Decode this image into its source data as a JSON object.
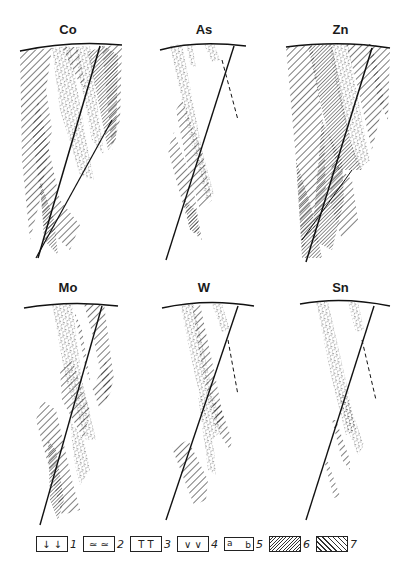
{
  "figure": {
    "panels": [
      {
        "id": "co",
        "label": "Co",
        "row": 1,
        "col": 1
      },
      {
        "id": "as",
        "label": "As",
        "row": 1,
        "col": 2
      },
      {
        "id": "zn",
        "label": "Zn",
        "row": 1,
        "col": 3
      },
      {
        "id": "mo",
        "label": "Mo",
        "row": 2,
        "col": 1
      },
      {
        "id": "w",
        "label": "W",
        "row": 2,
        "col": 2
      },
      {
        "id": "sn",
        "label": "Sn",
        "row": 2,
        "col": 3
      }
    ],
    "legend": [
      {
        "num": "1",
        "symbol": "↓ ↓",
        "name": "symbol-arrows"
      },
      {
        "num": "2",
        "symbol": "≃ ≃",
        "name": "symbol-tilde-dots"
      },
      {
        "num": "3",
        "symbol": "T  T",
        "name": "symbol-t"
      },
      {
        "num": "4",
        "symbol": "∨  ∨",
        "name": "symbol-v"
      },
      {
        "num": "5",
        "symbol_a": "a",
        "symbol_b": "b",
        "name": "symbol-ab-dashed"
      },
      {
        "num": "6",
        "symbol": "",
        "name": "fine-hatch"
      },
      {
        "num": "7",
        "symbol": "",
        "name": "coarse-hatch"
      }
    ]
  }
}
